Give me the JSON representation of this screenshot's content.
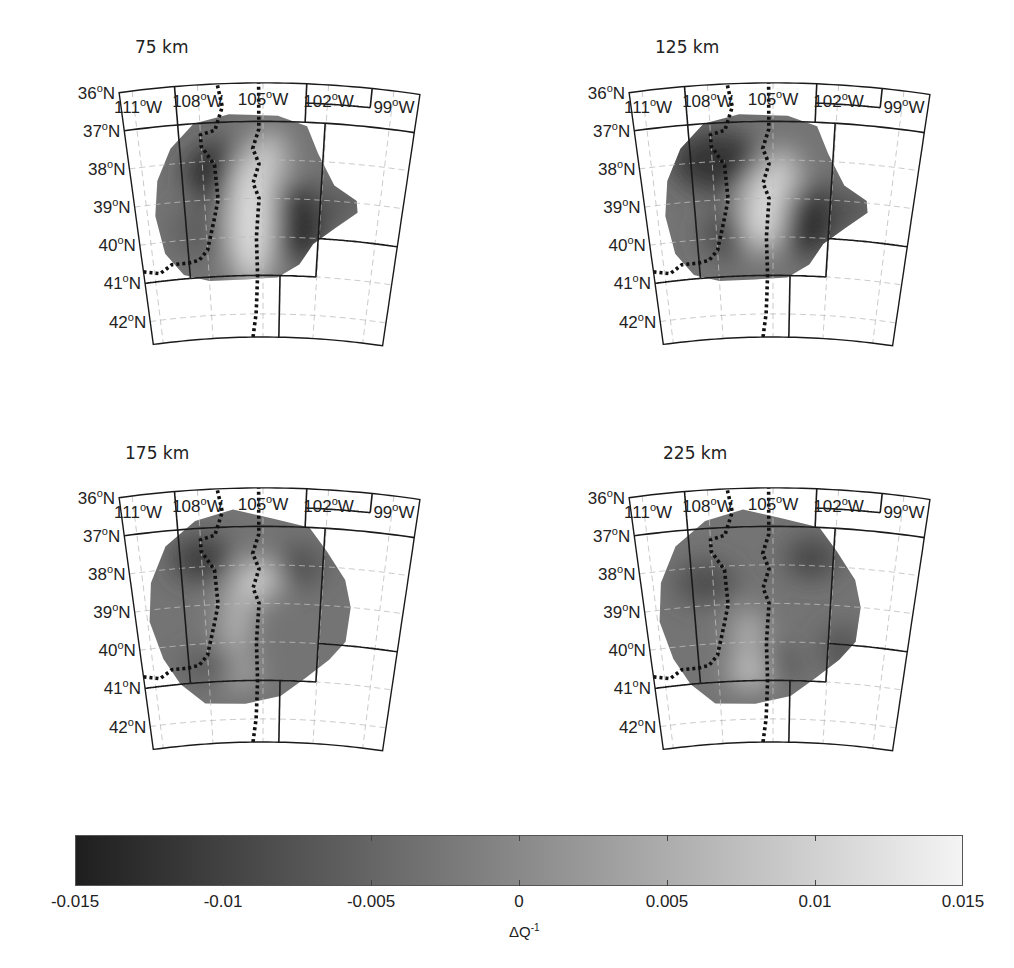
{
  "figure": {
    "colors": {
      "min": "#1e1e1e",
      "mid": "#8a8a8a",
      "max": "#f4f4f4",
      "frame": "#1a1a1a",
      "grid": "#bdbdbd"
    }
  },
  "chart_data": {
    "type": "heatmap",
    "title": "",
    "panels": [
      {
        "title": "75 km",
        "depth_km": 75,
        "anomalies": [
          {
            "lon": -107.0,
            "lat": 38.3,
            "value": -0.013,
            "rx": 38,
            "ry": 30
          },
          {
            "lon": -103.5,
            "lat": 39.6,
            "value": -0.013,
            "rx": 35,
            "ry": 38
          },
          {
            "lon": -108.3,
            "lat": 39.8,
            "value": -0.006,
            "rx": 30,
            "ry": 28
          },
          {
            "lon": -105.6,
            "lat": 39.5,
            "value": 0.012,
            "rx": 22,
            "ry": 70
          },
          {
            "lon": -104.7,
            "lat": 38.0,
            "value": 0.009,
            "rx": 18,
            "ry": 30
          },
          {
            "lon": -101.2,
            "lat": 39.1,
            "value": -0.007,
            "rx": 26,
            "ry": 16
          }
        ]
      },
      {
        "title": "125 km",
        "depth_km": 125,
        "anomalies": [
          {
            "lon": -107.8,
            "lat": 38.0,
            "value": -0.012,
            "rx": 44,
            "ry": 30
          },
          {
            "lon": -103.4,
            "lat": 39.5,
            "value": -0.013,
            "rx": 35,
            "ry": 36
          },
          {
            "lon": -107.3,
            "lat": 39.9,
            "value": -0.009,
            "rx": 28,
            "ry": 24
          },
          {
            "lon": -105.5,
            "lat": 39.3,
            "value": 0.012,
            "rx": 20,
            "ry": 42
          },
          {
            "lon": -104.6,
            "lat": 38.4,
            "value": 0.01,
            "rx": 18,
            "ry": 26
          },
          {
            "lon": -101.1,
            "lat": 39.2,
            "value": -0.008,
            "rx": 26,
            "ry": 16
          }
        ]
      },
      {
        "title": "175 km",
        "depth_km": 175,
        "anomalies": [
          {
            "lon": -108.0,
            "lat": 37.8,
            "value": -0.011,
            "rx": 30,
            "ry": 22
          },
          {
            "lon": -105.3,
            "lat": 38.4,
            "value": 0.011,
            "rx": 20,
            "ry": 20
          },
          {
            "lon": -106.5,
            "lat": 40.8,
            "value": 0.008,
            "rx": 22,
            "ry": 14
          },
          {
            "lon": -103.2,
            "lat": 38.0,
            "value": -0.008,
            "rx": 26,
            "ry": 20
          },
          {
            "lon": -107.8,
            "lat": 40.6,
            "value": -0.007,
            "rx": 30,
            "ry": 16
          },
          {
            "lon": -106.4,
            "lat": 39.4,
            "value": 0.006,
            "rx": 16,
            "ry": 40
          }
        ]
      },
      {
        "title": "225 km",
        "depth_km": 225,
        "anomalies": [
          {
            "lon": -108.4,
            "lat": 38.4,
            "value": -0.009,
            "rx": 30,
            "ry": 20
          },
          {
            "lon": -103.1,
            "lat": 37.8,
            "value": -0.01,
            "rx": 26,
            "ry": 20
          },
          {
            "lon": -105.1,
            "lat": 40.6,
            "value": -0.009,
            "rx": 26,
            "ry": 16
          },
          {
            "lon": -106.3,
            "lat": 40.8,
            "value": 0.009,
            "rx": 22,
            "ry": 14
          },
          {
            "lon": -106.3,
            "lat": 39.8,
            "value": 0.006,
            "rx": 16,
            "ry": 26
          },
          {
            "lon": -101.3,
            "lat": 40.1,
            "value": -0.008,
            "rx": 20,
            "ry": 22
          }
        ]
      }
    ],
    "x_ticks": [
      "111°W",
      "108°W",
      "105°W",
      "102°W",
      "99°W"
    ],
    "x_tick_values": [
      -111,
      -108,
      -105,
      -102,
      -99
    ],
    "y_ticks": [
      "36°N",
      "37°N",
      "38°N",
      "39°N",
      "40°N",
      "41°N",
      "42°N"
    ],
    "y_tick_values": [
      36,
      37,
      38,
      39,
      40,
      41,
      42
    ],
    "xlabel": "",
    "ylabel": "",
    "colorbar": {
      "label": "ΔQ",
      "label_superscript": "-1",
      "range": [
        -0.015,
        0.015
      ],
      "ticks": [
        -0.015,
        -0.01,
        -0.005,
        0,
        0.005,
        0.01,
        0.015
      ],
      "tick_labels": [
        "-0.015",
        "-0.01",
        "-0.005",
        "0",
        "0.005",
        "0.01",
        "0.015"
      ],
      "colormap": "gray (dark = negative, light = positive)"
    },
    "grid": true
  },
  "ticklabels": {
    "lat": [
      {
        "num": "42",
        "sup": "o",
        "dir": "N"
      },
      {
        "num": "41",
        "sup": "o",
        "dir": "N"
      },
      {
        "num": "40",
        "sup": "o",
        "dir": "N"
      },
      {
        "num": "39",
        "sup": "o",
        "dir": "N"
      },
      {
        "num": "38",
        "sup": "o",
        "dir": "N"
      },
      {
        "num": "37",
        "sup": "o",
        "dir": "N"
      },
      {
        "num": "36",
        "sup": "o",
        "dir": "N"
      }
    ],
    "lon": [
      {
        "num": "111",
        "sup": "o",
        "dir": "W"
      },
      {
        "num": "108",
        "sup": "o",
        "dir": "W"
      },
      {
        "num": "105",
        "sup": "o",
        "dir": "W"
      },
      {
        "num": "102",
        "sup": "o",
        "dir": "W"
      },
      {
        "num": "99",
        "sup": "o",
        "dir": "W"
      }
    ]
  }
}
